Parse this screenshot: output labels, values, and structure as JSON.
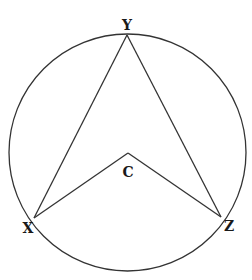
{
  "diagram": {
    "type": "circle-geometry",
    "circle": {
      "cx": 127.5,
      "cy": 152.5,
      "r": 118.5,
      "stroke": "#333333"
    },
    "points": {
      "Y": {
        "label": "Y",
        "x": 127,
        "y": 35,
        "label_x": 127,
        "label_y": 30
      },
      "X": {
        "label": "X",
        "x": 34,
        "y": 218,
        "label_x": 28,
        "label_y": 233
      },
      "Z": {
        "label": "Z",
        "x": 221,
        "y": 217,
        "label_x": 229,
        "label_y": 231
      },
      "C": {
        "label": "C",
        "x": 128,
        "y": 153,
        "label_x": 128,
        "label_y": 177
      }
    },
    "segments": [
      [
        "X",
        "Y"
      ],
      [
        "Y",
        "Z"
      ],
      [
        "X",
        "C"
      ],
      [
        "C",
        "Z"
      ]
    ],
    "line_color": "#333333"
  }
}
